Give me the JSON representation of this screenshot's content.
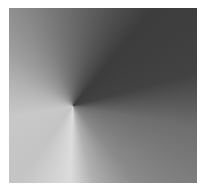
{
  "image": {
    "description": "conic-gradient-square",
    "colors": {
      "darkest": "#3c3c3c",
      "mid": "#7a7a7a",
      "lightest": "#dcdcdc",
      "background": "#ffffff"
    }
  }
}
